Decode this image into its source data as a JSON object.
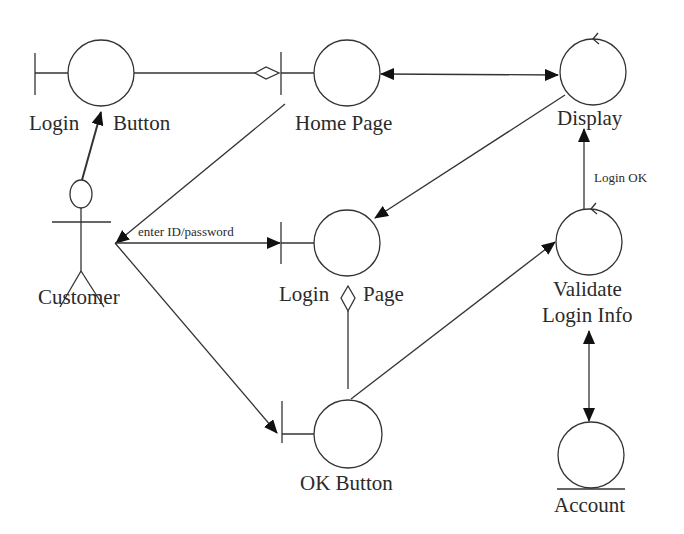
{
  "diagram": {
    "type": "UML robustness / collaboration diagram",
    "actors": [
      {
        "id": "customer",
        "label": "Customer"
      }
    ],
    "boundaries": [
      {
        "id": "login_button",
        "label_left": "Login",
        "label_right": "Button"
      },
      {
        "id": "home_page",
        "label": "Home Page"
      },
      {
        "id": "login_page",
        "label_left": "Login",
        "label_right": "Page"
      },
      {
        "id": "ok_button",
        "label": "OK Button"
      }
    ],
    "controls": [
      {
        "id": "display",
        "label": "Display"
      },
      {
        "id": "validate",
        "label_line1": "Validate",
        "label_line2": "Login Info"
      }
    ],
    "entities": [
      {
        "id": "account",
        "label": "Account"
      }
    ],
    "messages": {
      "enter_id": "enter ID/password",
      "login_ok": "Login OK"
    },
    "connections": [
      {
        "from": "login_button",
        "to": "home_page",
        "kind": "aggregation"
      },
      {
        "from": "customer",
        "to": "login_button",
        "kind": "arrow"
      },
      {
        "from": "home_page",
        "to": "display",
        "kind": "bidirectional"
      },
      {
        "from": "home_page",
        "to": "customer",
        "kind": "arrow"
      },
      {
        "from": "display",
        "to": "login_page",
        "kind": "arrow"
      },
      {
        "from": "customer",
        "to": "login_page",
        "kind": "arrow",
        "label": "enter ID/password"
      },
      {
        "from": "customer",
        "to": "ok_button",
        "kind": "arrow"
      },
      {
        "from": "ok_button",
        "to": "login_page",
        "kind": "aggregation"
      },
      {
        "from": "ok_button",
        "to": "validate",
        "kind": "arrow"
      },
      {
        "from": "validate",
        "to": "display",
        "kind": "arrow",
        "label": "Login OK"
      },
      {
        "from": "validate",
        "to": "account",
        "kind": "bidirectional"
      }
    ]
  }
}
